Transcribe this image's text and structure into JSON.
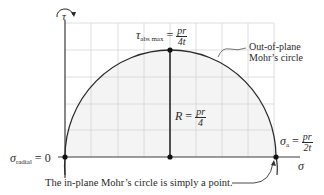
{
  "axes": {
    "tau_label": "τ",
    "sigma_label": "σ"
  },
  "labels": {
    "tau_abs_max": {
      "symbol": "τ",
      "subscript": "abs max",
      "eq": "=",
      "num": "pr",
      "den": "4t"
    },
    "radius": {
      "symbol": "R",
      "eq": "=",
      "num": "pr",
      "den": "4"
    },
    "sigma_a": {
      "symbol": "σ",
      "subscript": "a",
      "eq": "=",
      "num": "pr",
      "den": "2t"
    },
    "sigma_radial": {
      "symbol": "σ",
      "subscript": "radial",
      "eq": "= 0"
    },
    "out_of_plane_line1": "Out-of-plane",
    "out_of_plane_line2": "Mohr’s circle",
    "in_plane_note": "The in-plane Mohr’s circle is simply a point."
  },
  "colors": {
    "grid": "#d4d4d4",
    "fill": "#f4f4f4",
    "axis": "#3a3a3a",
    "curve": "#2a2a2a"
  },
  "geometry": {
    "origin": [
      65,
      157
    ],
    "center": [
      170,
      157
    ],
    "top_point": [
      170,
      50
    ],
    "right_point": [
      276,
      157
    ],
    "radius_px": 106
  }
}
